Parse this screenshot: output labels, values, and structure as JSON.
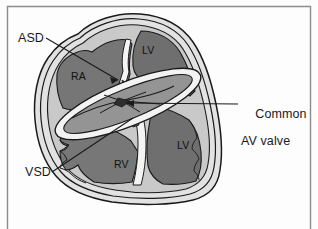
{
  "figure": {
    "kind": "anatomical-diagram",
    "frame_border_color": "#8c8c8c",
    "background_color": "#fdfdfd"
  },
  "palette": {
    "outline": "#1a1a1a",
    "myocardium_light": "#c9c9c9",
    "epicardium_pale": "#dcdcdc",
    "chamber_dark": "#6f6f6f",
    "chamber_mid": "#8b8b8b",
    "septum_white": "#f2f2f2",
    "valve_gray": "#9a9a9a",
    "text": "#1a1a1a"
  },
  "callouts": [
    {
      "id": "asd",
      "text": "ASD",
      "lines": [
        "ASD"
      ]
    },
    {
      "id": "vsd",
      "text": "VSD",
      "lines": [
        "VSD"
      ]
    },
    {
      "id": "common-av-valve",
      "text": "Common AV valve",
      "lines": [
        "Common",
        "AV valve"
      ]
    }
  ],
  "labels": {
    "asd": "ASD",
    "vsd": "VSD",
    "common_line1": "Common",
    "common_line2": "AV valve",
    "ra": "RA",
    "lv_top": "LV",
    "lv_bottom": "LV",
    "rv": "RV"
  },
  "chambers": [
    {
      "abbr": "RA",
      "name": "right atrium"
    },
    {
      "abbr": "LV",
      "name": "left ventricle (upper/atrial-side portion)"
    },
    {
      "abbr": "LV",
      "name": "left ventricle"
    },
    {
      "abbr": "RV",
      "name": "right ventricle"
    }
  ]
}
